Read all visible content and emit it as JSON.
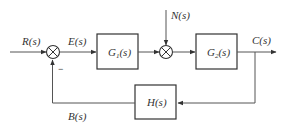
{
  "diagram": {
    "type": "control-block-diagram",
    "signals": {
      "input": "R(s)",
      "error": "E(s)",
      "disturbance": "N(s)",
      "output": "C(s)",
      "feedback": "B(s)"
    },
    "blocks": [
      {
        "id": "G1",
        "main": "G",
        "sub": "1",
        "arg": "(s)"
      },
      {
        "id": "G2",
        "main": "G",
        "sub": "2",
        "arg": "(s)"
      },
      {
        "id": "H",
        "main": "H",
        "sub": "",
        "arg": "(s)"
      }
    ],
    "summing_junctions": [
      {
        "id": "sum1",
        "inputs": [
          "R(s)",
          "B(s)"
        ],
        "signs": [
          "+",
          "-"
        ]
      },
      {
        "id": "sum2",
        "inputs": [
          "G1 output",
          "N(s)"
        ],
        "signs": [
          "+",
          "+"
        ]
      }
    ],
    "minus_sign": "−",
    "colors": {
      "line": "#555555",
      "text": "#333333",
      "background": "#ffffff"
    }
  }
}
